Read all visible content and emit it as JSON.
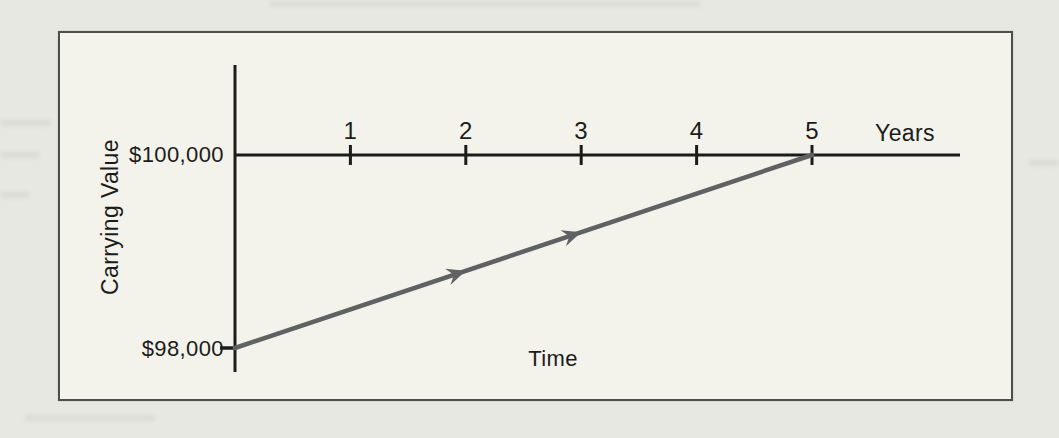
{
  "colors": {
    "page_background": "#e7e8e1",
    "panel_background": "#f3f3ec",
    "panel_border": "#4e4f48",
    "axis": "#1c1c1a",
    "text": "#1c1c1a",
    "ghost": "#9aa094"
  },
  "chart_data": {
    "type": "line",
    "title": "",
    "xlabel": "Time",
    "x_axis_unit_label": "Years",
    "ylabel": "Carrying Value",
    "xlim": [
      0,
      5
    ],
    "ylim": [
      98000,
      100000
    ],
    "x_ticks": [
      1,
      2,
      3,
      4,
      5
    ],
    "y_ticks": [
      {
        "value": 100000,
        "label": "$100,000"
      },
      {
        "value": 98000,
        "label": "$98,000"
      }
    ],
    "grid": false,
    "legend": false,
    "series": [
      {
        "name": "carrying-value",
        "points": [
          [
            0,
            98000
          ],
          [
            5,
            100000
          ]
        ],
        "color": "#606163",
        "arrow_fractions": [
          0.4,
          0.6
        ]
      }
    ]
  }
}
